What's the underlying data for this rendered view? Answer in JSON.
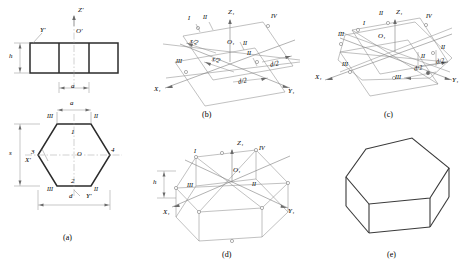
{
  "figure": {
    "captions": [
      {
        "id": "a",
        "text": "(a)",
        "x": 68,
        "y": 239
      },
      {
        "id": "b",
        "text": "(b)",
        "x": 207,
        "y": 118
      },
      {
        "id": "c",
        "text": "(c)",
        "x": 389,
        "y": 118
      },
      {
        "id": "d",
        "text": "(d)",
        "x": 227,
        "y": 258
      },
      {
        "id": "e",
        "text": "(e)",
        "x": 392,
        "y": 258
      }
    ]
  },
  "panel_a": {
    "name": "orthographic-views",
    "front_view": {
      "axis_labels": [
        {
          "text": "Z'",
          "x": 83,
          "y": 12
        },
        {
          "text": "O'",
          "x": 80,
          "y": 32
        },
        {
          "text": "Y'",
          "x": 36,
          "y": 30
        }
      ],
      "dimensions": [
        {
          "text": "h",
          "x": 14,
          "y": 58
        },
        {
          "text": "a",
          "x": 82,
          "y": 91
        }
      ]
    },
    "top_view": {
      "vertex_labels": [
        {
          "text": "1",
          "x": 73,
          "y": 133
        },
        {
          "text": "2",
          "x": 73,
          "y": 185
        },
        {
          "text": "3",
          "x": 38,
          "y": 155
        },
        {
          "text": "4",
          "x": 113,
          "y": 153
        },
        {
          "text": "O",
          "x": 79,
          "y": 158
        }
      ],
      "roman_labels": [
        {
          "text": "III",
          "x": 52,
          "y": 116
        },
        {
          "text": "II",
          "x": 97,
          "y": 116
        },
        {
          "text": "III",
          "x": 52,
          "y": 195
        },
        {
          "text": "II",
          "x": 97,
          "y": 195
        }
      ],
      "axis_labels": [
        {
          "text": "X'",
          "x": 30,
          "y": 163
        },
        {
          "text": "Y'",
          "x": 88,
          "y": 200
        }
      ],
      "dimensions": [
        {
          "text": "a",
          "x": 78,
          "y": 107
        },
        {
          "text": "s",
          "x": 14,
          "y": 155
        },
        {
          "text": "d",
          "x": 76,
          "y": 200
        }
      ]
    }
  },
  "panel_b": {
    "name": "isometric-axes-with-halves",
    "axis_labels": [
      {
        "text": "Z₁",
        "x": 232,
        "y": 16
      },
      {
        "text": "O₁",
        "x": 231,
        "y": 44
      },
      {
        "text": "X₁",
        "x": 159,
        "y": 92
      },
      {
        "text": "Y₁",
        "x": 292,
        "y": 94
      }
    ],
    "roman_labels": [
      {
        "text": "I",
        "x": 190,
        "y": 21
      },
      {
        "text": "II",
        "x": 205,
        "y": 20
      },
      {
        "text": "IV",
        "x": 274,
        "y": 19
      },
      {
        "text": "III",
        "x": 181,
        "y": 64
      },
      {
        "text": "II",
        "x": 249,
        "y": 56
      },
      {
        "text": "II",
        "x": 245,
        "y": 46
      }
    ],
    "dimensions": [
      {
        "text": "s/2",
        "x": 196,
        "y": 45
      },
      {
        "text": "s/2",
        "x": 218,
        "y": 62
      },
      {
        "text": "d/2",
        "x": 275,
        "y": 67
      },
      {
        "text": "d/2",
        "x": 243,
        "y": 84
      }
    ]
  },
  "panel_c": {
    "name": "hexagon-in-isometric-plane",
    "axis_labels": [
      {
        "text": "Z₁",
        "x": 400,
        "y": 16
      },
      {
        "text": "O₁",
        "x": 382,
        "y": 38
      },
      {
        "text": "X₁",
        "x": 320,
        "y": 80
      },
      {
        "text": "Y₁",
        "x": 456,
        "y": 83
      }
    ],
    "roman_labels": [
      {
        "text": "I",
        "x": 365,
        "y": 26
      },
      {
        "text": "II",
        "x": 381,
        "y": 16
      },
      {
        "text": "IV",
        "x": 429,
        "y": 19
      },
      {
        "text": "III",
        "x": 344,
        "y": 37
      },
      {
        "text": "III",
        "x": 348,
        "y": 67
      },
      {
        "text": "III",
        "x": 400,
        "y": 80
      },
      {
        "text": "II",
        "x": 424,
        "y": 59
      },
      {
        "text": "II",
        "x": 444,
        "y": 50
      }
    ],
    "dimensions": [
      {
        "text": "d/2",
        "x": 419,
        "y": 70
      },
      {
        "text": "d/2",
        "x": 440,
        "y": 63
      }
    ]
  },
  "panel_d": {
    "name": "hexagonal-prism-wireframe",
    "axis_labels": [
      {
        "text": "Z₁",
        "x": 241,
        "y": 146
      },
      {
        "text": "O₁",
        "x": 237,
        "y": 172
      },
      {
        "text": "X₁",
        "x": 167,
        "y": 215
      },
      {
        "text": "Y₁",
        "x": 291,
        "y": 214
      }
    ],
    "roman_labels": [
      {
        "text": "I",
        "x": 196,
        "y": 154
      },
      {
        "text": "IV",
        "x": 262,
        "y": 151
      },
      {
        "text": "III",
        "x": 192,
        "y": 188
      },
      {
        "text": "II",
        "x": 254,
        "y": 187
      }
    ],
    "dimensions": [
      {
        "text": "h",
        "x": 158,
        "y": 184
      }
    ]
  },
  "panel_e": {
    "name": "finished-solid-hexagonal-prism"
  }
}
